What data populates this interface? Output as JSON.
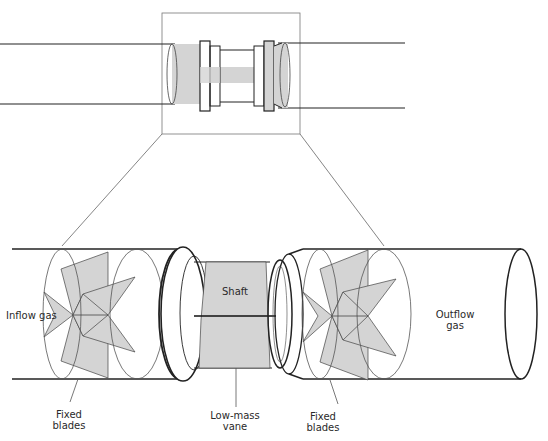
{
  "diagram": {
    "type": "turbine flowmeter cross-section",
    "colors": {
      "stroke": "#222222",
      "thin_stroke": "#555555",
      "fill": "#d4d4d4",
      "background": "#ffffff"
    },
    "labels": {
      "inflow": "Inflow  gas",
      "shaft": "Shaft",
      "outflow": "Outflow\ngas",
      "fixed_blades_left": "Fixed\nblades",
      "low_mass_vane": "Low-mass\nvane",
      "fixed_blades_right": "Fixed\nblades"
    }
  }
}
